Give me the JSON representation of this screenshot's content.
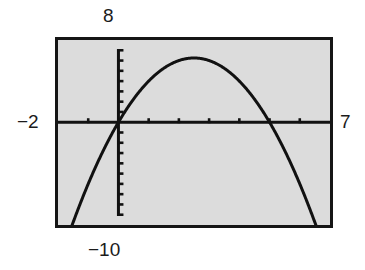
{
  "figure": {
    "kind": "graphing-calculator-screen",
    "screen_background_color": "#dcdcdc",
    "border_color": "#151515",
    "trace_color": "#111111",
    "labels": {
      "ymax": "8",
      "ymin": "−10",
      "xmin": "−2",
      "xmax": "7"
    }
  },
  "chart_data": {
    "type": "line",
    "title": "",
    "subtitle": "",
    "xlabel": "",
    "ylabel": "",
    "grid": false,
    "legend": null,
    "legend_position": "none",
    "xlim": [
      -2,
      7
    ],
    "ylim": [
      -10,
      8
    ],
    "x_tick_interval": 1,
    "y_tick_interval": 1,
    "x_ticks": [
      -2,
      -1,
      0,
      1,
      2,
      3,
      4,
      5,
      6,
      7
    ],
    "y_ticks": [
      -10,
      -9,
      -8,
      -7,
      -6,
      -5,
      -4,
      -3,
      -2,
      -1,
      0,
      1,
      2,
      3,
      4,
      5,
      6,
      7,
      8
    ],
    "axis_style": "calculator-axes-with-tick-marks",
    "annotations": [
      {
        "text": "8",
        "role": "window-ymax",
        "position": "above-screen-at-y-axis"
      },
      {
        "text": "−10",
        "role": "window-ymin",
        "position": "below-screen-at-y-axis"
      },
      {
        "text": "−2",
        "role": "window-xmin",
        "position": "left-of-screen-at-x-axis"
      },
      {
        "text": "7",
        "role": "window-xmax",
        "position": "right-of-screen-at-x-axis"
      }
    ],
    "series": [
      {
        "name": "parabola",
        "kind": "quadratic",
        "equation": "y = -x^2 + 5x",
        "vertex": [
          2.5,
          6.25
        ],
        "roots": [
          0,
          5
        ],
        "opens": "down",
        "x": [
          -2,
          -1.75,
          -1.5,
          -1.25,
          -1,
          -0.75,
          -0.5,
          -0.25,
          0,
          0.25,
          0.5,
          0.75,
          1,
          1.25,
          1.5,
          1.75,
          2,
          2.25,
          2.5,
          2.75,
          3,
          3.25,
          3.5,
          3.75,
          4,
          4.25,
          4.5,
          4.75,
          5,
          5.25,
          5.5,
          5.75,
          6,
          6.25,
          6.5,
          6.75,
          7
        ],
        "values": [
          -14,
          -11.8125,
          -9.75,
          -7.8125,
          -6,
          -4.3125,
          -2.75,
          -1.3125,
          0,
          1.1875,
          2.25,
          3.1875,
          4,
          4.6875,
          5.25,
          5.6875,
          6,
          6.1875,
          6.25,
          6.1875,
          6,
          5.6875,
          5.25,
          4.6875,
          4,
          3.1875,
          2.25,
          1.1875,
          0,
          -1.3125,
          -2.75,
          -4.3125,
          -6,
          -7.8125,
          -9.75,
          -11.8125,
          -14
        ]
      }
    ]
  }
}
